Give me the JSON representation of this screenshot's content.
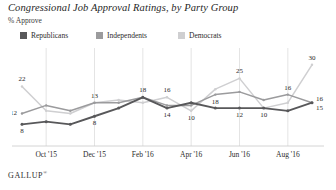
{
  "header": {
    "title": "Congressional Job Approval Ratings, by Party Group",
    "subtitle": "% Approve"
  },
  "legend": {
    "items": [
      {
        "label": "Republicans",
        "color": "#58585a"
      },
      {
        "label": "Independents",
        "color": "#9b9b9d"
      },
      {
        "label": "Democrats",
        "color": "#cfcfd1"
      }
    ]
  },
  "footer": {
    "brand": "GALLUP",
    "mark": "®"
  },
  "chart_data": {
    "type": "line",
    "title": "Congressional Job Approval Ratings, by Party Group",
    "subtitle": "% Approve",
    "xlabel": "",
    "ylabel": "% Approve",
    "ylim": [
      0,
      34
    ],
    "grid": "vertical",
    "legend_position": "top-left",
    "x": [
      "Sep '15",
      "Oct '15",
      "Nov '15",
      "Dec '15",
      "Jan '16",
      "Feb '16",
      "Mar '16",
      "Apr '16",
      "May '16",
      "Jun '16",
      "Jul '16",
      "Aug '16",
      "Sep '16"
    ],
    "tick_labels": [
      "Oct '15",
      "Dec '15",
      "Feb '16",
      "Apr '16",
      "Jun '16",
      "Aug '16"
    ],
    "tick_indices": [
      1,
      3,
      5,
      7,
      9,
      11
    ],
    "series": [
      {
        "name": "Republicans",
        "color": "#58585a",
        "values": [
          8,
          9,
          8,
          11,
          14,
          18,
          14,
          16,
          14,
          14,
          14,
          13,
          16
        ],
        "labels": [
          {
            "index": 0,
            "value": 8,
            "pos": "below"
          },
          {
            "index": 3,
            "value": 8,
            "pos": "below"
          },
          {
            "index": 6,
            "value": 14,
            "pos": "below"
          },
          {
            "index": 9,
            "value": 12,
            "pos": "below"
          },
          {
            "index": 12,
            "value": 15,
            "pos": "right-below"
          }
        ]
      },
      {
        "name": "Independents",
        "color": "#9b9b9d",
        "values": [
          12,
          15,
          13,
          16,
          16,
          18,
          15,
          15,
          19,
          20,
          17,
          19,
          16
        ],
        "labels": [
          {
            "index": 0,
            "value": 12,
            "pos": "left"
          },
          {
            "index": 3,
            "value": 13,
            "pos": "above"
          },
          {
            "index": 5,
            "value": 18,
            "pos": "above"
          },
          {
            "index": 8,
            "value": 18,
            "pos": "below"
          },
          {
            "index": 11,
            "value": 16,
            "pos": "above"
          },
          {
            "index": 12,
            "value": 16,
            "pos": "right-above"
          }
        ]
      },
      {
        "name": "Democrats",
        "color": "#cfcfd1",
        "values": [
          22,
          13,
          12,
          16,
          17,
          16,
          18,
          13,
          21,
          25,
          14,
          16,
          30
        ],
        "labels": [
          {
            "index": 0,
            "value": 22,
            "pos": "above"
          },
          {
            "index": 6,
            "value": 16,
            "pos": "above"
          },
          {
            "index": 7,
            "value": 10,
            "pos": "below"
          },
          {
            "index": 9,
            "value": 25,
            "pos": "above"
          },
          {
            "index": 10,
            "value": 10,
            "pos": "below"
          },
          {
            "index": 12,
            "value": 30,
            "pos": "above"
          }
        ]
      }
    ]
  }
}
